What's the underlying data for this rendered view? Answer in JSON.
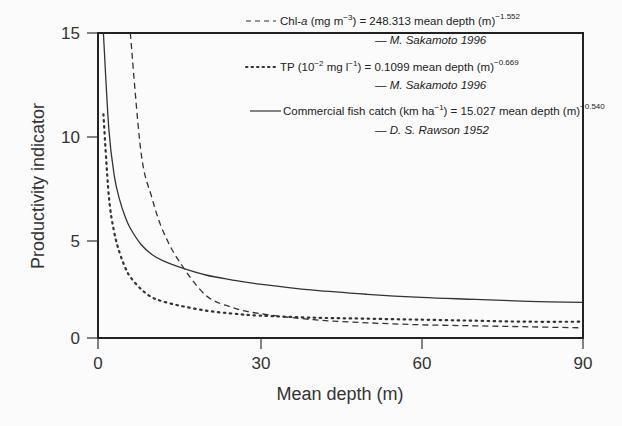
{
  "chart_data": {
    "type": "line",
    "title": "",
    "xlabel": "Mean depth (m)",
    "ylabel": "Productivity indicator",
    "xlim": [
      0,
      90
    ],
    "ylim": [
      0,
      15
    ],
    "xticks": [
      0,
      30,
      60,
      90
    ],
    "yticks": [
      0,
      5,
      10,
      15
    ],
    "grid": false,
    "legend_position": "upper right (inside)",
    "x": [
      1,
      2,
      3,
      4,
      5,
      6,
      8,
      10,
      12,
      15,
      20,
      25,
      30,
      40,
      50,
      60,
      70,
      80,
      90
    ],
    "series": [
      {
        "name": "Chl-a (mg m^-3) = 248.313 mean depth (m)^-1.552",
        "source": "M. Sakamoto 1996",
        "style": "dashed",
        "values": [
          null,
          null,
          null,
          null,
          null,
          15.0,
          9.1,
          6.9,
          5.3,
          3.8,
          2.1,
          1.5,
          1.2,
          0.9,
          0.75,
          0.65,
          0.6,
          0.55,
          0.5
        ]
      },
      {
        "name": "TP (10^-2 mg l^-1) = 0.1099 mean depth (m)^-0.669",
        "source": "M. Sakamoto 1996",
        "style": "dotted",
        "values": [
          11.0,
          7.0,
          5.2,
          4.2,
          3.5,
          3.0,
          2.4,
          2.0,
          1.8,
          1.6,
          1.35,
          1.2,
          1.1,
          1.0,
          0.95,
          0.9,
          0.85,
          0.8,
          0.8
        ]
      },
      {
        "name": "Commercial fish catch (km ha^-1) = 15.027 mean depth (m)^-0.540",
        "source": "D. S. Rawson 1952",
        "style": "solid",
        "values": [
          15.0,
          10.3,
          8.0,
          6.8,
          6.0,
          5.4,
          4.6,
          4.1,
          3.8,
          3.5,
          3.1,
          2.85,
          2.65,
          2.35,
          2.15,
          2.0,
          1.9,
          1.8,
          1.75
        ]
      }
    ]
  },
  "axes": {
    "xlabel": "Mean depth (m)",
    "ylabel": "Productivity indicator",
    "xtick_labels": [
      "0",
      "30",
      "60",
      "90"
    ],
    "ytick_labels": [
      "0",
      "5",
      "10",
      "15"
    ]
  },
  "legend": {
    "chl": {
      "label_pre": "Chl-",
      "label_a": "a",
      "label_unit": " (mg m",
      "unit_sup": "−3",
      "label_eq": ") = 248.313 mean depth (m)",
      "exp": "−1.552",
      "source": "— M. Sakamoto 1996"
    },
    "tp": {
      "label_pre": "TP (10",
      "sup1": "−2",
      "label_mid": " mg l",
      "sup2": "−1",
      "label_eq": ") = 0.1099 mean depth (m)",
      "exp": "−0.669",
      "source": "— M. Sakamoto 1996"
    },
    "fish": {
      "label_pre": "Commercial fish catch (km ha",
      "sup1": "−1",
      "label_eq": ") = 15.027 mean depth (m)",
      "exp": "−0.540",
      "source": "— D. S. Rawson 1952"
    }
  }
}
